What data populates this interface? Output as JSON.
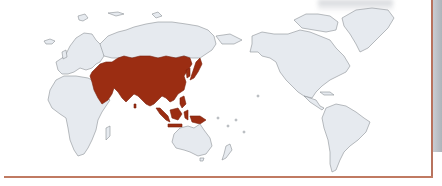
{
  "map": {
    "type": "world-map",
    "projection": "Pacific-centered equirectangular",
    "highlighted_region": "Asia",
    "colors": {
      "highlight": "#9b2d12",
      "land": "#e6eaef",
      "border": "#8c9096",
      "ocean": "#ffffff",
      "frame": "#b8735e"
    },
    "regions": [
      {
        "name": "Europe",
        "highlighted": false
      },
      {
        "name": "Africa",
        "highlighted": false
      },
      {
        "name": "Asia",
        "highlighted": true
      },
      {
        "name": "Russia",
        "highlighted": false
      },
      {
        "name": "Australia",
        "highlighted": false
      },
      {
        "name": "New Zealand",
        "highlighted": false
      },
      {
        "name": "North America",
        "highlighted": false
      },
      {
        "name": "Greenland",
        "highlighted": false
      },
      {
        "name": "South America",
        "highlighted": false
      }
    ]
  }
}
